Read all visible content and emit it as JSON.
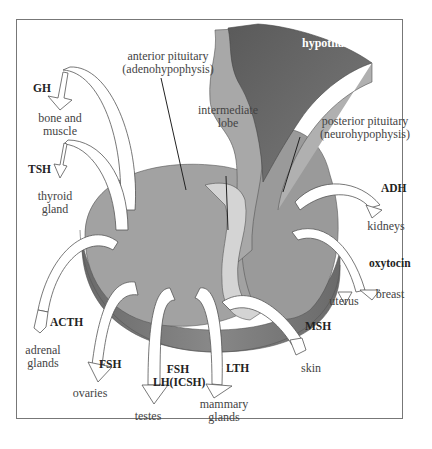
{
  "diagram": {
    "structures": {
      "hypothalamus": "hypothalamus",
      "anterior_pituitary": [
        "anterior pituitary",
        "(adenohypophysis)"
      ],
      "intermediate_lobe": [
        "intermediate",
        "lobe"
      ],
      "posterior_pituitary": [
        "posterior pituitary",
        "(neurohypophysis)"
      ]
    },
    "pathways": [
      {
        "hormone": "GH",
        "target": [
          "bone and",
          "muscle"
        ],
        "source": "anterior"
      },
      {
        "hormone": "TSH",
        "target": [
          "thyroid",
          "gland"
        ],
        "source": "anterior"
      },
      {
        "hormone": "ACTH",
        "target": [
          "adrenal",
          "glands"
        ],
        "source": "anterior"
      },
      {
        "hormone": "FSH",
        "target": [
          "ovaries"
        ],
        "source": "anterior"
      },
      {
        "hormone": [
          "FSH",
          "LH(ICSH)"
        ],
        "target": [
          "testes"
        ],
        "source": "anterior"
      },
      {
        "hormone": "LTH",
        "target": [
          "mammary",
          "glands"
        ],
        "source": "anterior"
      },
      {
        "hormone": "MSH",
        "target": [
          "skin"
        ],
        "source": "intermediate"
      },
      {
        "hormone": "ADH",
        "target": [
          "kidneys"
        ],
        "source": "posterior"
      },
      {
        "hormone": "oxytocin",
        "target": [
          "uterus",
          "breast"
        ],
        "source": "posterior"
      }
    ],
    "colors": {
      "hypothalamus": "#6e6e6e",
      "stalk": "#a8a8a8",
      "anterior_top": "#a0a0a0",
      "anterior_side": "#7a7a7a",
      "intermediate": "#d2d2d2",
      "posterior": "#9a9a9a",
      "arrow_fill": "#ffffff",
      "arrow_stroke": "#555555",
      "frame": "#777777"
    }
  }
}
